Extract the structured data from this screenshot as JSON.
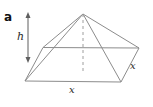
{
  "figure": {
    "panel_label": "a"
  },
  "colors": {
    "background": "#ffffff",
    "line": "#8c8c8c",
    "dashed_line": "#9e9e9e",
    "arrow": "#5f5f5f",
    "text": "#2a2a2a"
  },
  "diagram": {
    "type": "pyramid-3d-sketch",
    "width": 153,
    "height": 107,
    "vertices": {
      "apex": [
        83,
        14
      ],
      "back_left": [
        43,
        47.5
      ],
      "back_right": [
        139,
        48
      ],
      "front_left": [
        25,
        81
      ],
      "front_right": [
        121,
        82
      ],
      "base_center": [
        83,
        73
      ]
    },
    "edges": [
      {
        "from": "apex",
        "to": "front_left"
      },
      {
        "from": "apex",
        "to": "back_left"
      },
      {
        "from": "apex",
        "to": "back_right"
      },
      {
        "from": "apex",
        "to": "front_right"
      },
      {
        "from": "back_left",
        "to": "back_right"
      },
      {
        "from": "front_left",
        "to": "front_right"
      },
      {
        "from": "front_left",
        "to": "back_left"
      },
      {
        "from": "front_right",
        "to": "back_right"
      }
    ],
    "height_axis": {
      "from": "apex",
      "to": "base_center",
      "dashed": true
    },
    "dimension_arrow": {
      "x": 28,
      "y1": 12,
      "y2": 63,
      "double_headed": true
    },
    "labels": [
      {
        "id": "height-label",
        "text": "h",
        "x": 17,
        "y": 40,
        "size": 11
      },
      {
        "id": "base-side-label",
        "text": "x",
        "x": 69,
        "y": 93,
        "size": 10
      },
      {
        "id": "right-side-label",
        "text": "x",
        "x": 130,
        "y": 69,
        "size": 10
      }
    ]
  }
}
